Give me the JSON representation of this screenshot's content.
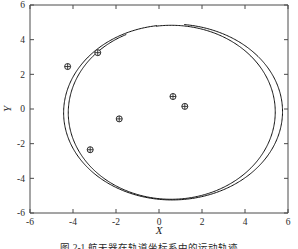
{
  "figure": {
    "caption": "图 2-1  航天器在轨道坐标系中的运动轨迹",
    "caption_visible_fragment": "图"
  },
  "chart_data": {
    "type": "line",
    "title": "",
    "xlabel": "X",
    "ylabel": "Y",
    "xlim": [
      -6,
      6
    ],
    "ylim": [
      -6,
      6
    ],
    "xticks": [
      -6,
      -4,
      -2,
      0,
      2,
      4,
      6
    ],
    "yticks": [
      -6,
      -4,
      -2,
      0,
      2,
      4,
      6
    ],
    "xtick_labels": [
      "-6",
      "-4",
      "-2",
      "0",
      "2",
      "4",
      "6"
    ],
    "ytick_labels": [
      "-6",
      "-4",
      "-2",
      "0",
      "2",
      "4",
      "6"
    ],
    "grid": false,
    "legend": false,
    "legend_position": "none",
    "series": [
      {
        "name": "trajectory-loop-inner",
        "type": "closed-curve",
        "description": "near-elliptical orbit trace, first revolution",
        "center": [
          0.55,
          -0.2
        ],
        "semi_axis_x": 4.75,
        "semi_axis_y": 5.0,
        "start_point": [
          -1.0,
          4.32
        ],
        "end_point": [
          0.05,
          -5.12
        ]
      },
      {
        "name": "trajectory-loop-outer",
        "type": "closed-curve",
        "description": "second revolution, slightly drifted outward on +X side",
        "center": [
          0.62,
          -0.18
        ],
        "semi_axis_x": 5.18,
        "semi_axis_y": 5.08,
        "start_point": [
          -0.35,
          4.78
        ],
        "end_point": [
          0.35,
          -5.28
        ]
      }
    ],
    "markers": {
      "name": "sample-points",
      "symbol": "circle-plus",
      "count": 6,
      "points": [
        {
          "x": -4.25,
          "y": 2.45
        },
        {
          "x": -2.85,
          "y": 3.25
        },
        {
          "x": -1.85,
          "y": -0.57
        },
        {
          "x": -3.2,
          "y": -2.35
        },
        {
          "x": 0.65,
          "y": 0.72
        },
        {
          "x": 1.2,
          "y": 0.15
        }
      ]
    },
    "colors": {
      "curve": "#111111",
      "marker_stroke": "#2a2a2a",
      "axis": "#4a4a4a",
      "background": "#ffffff"
    }
  }
}
